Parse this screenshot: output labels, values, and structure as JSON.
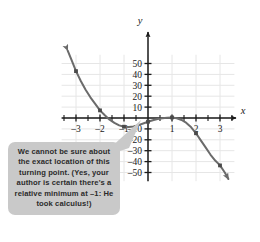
{
  "figure": {
    "background_color": "#ffffff"
  },
  "callout": {
    "text": "We cannot be sure about the exact location of this turning point. (Yes, your author is certain there's a relative minimum at –1: He took calculus!)",
    "background_color": "#c9c9c9",
    "text_color": "#2b2b2b",
    "pointer_target": "turning point near x = -1"
  },
  "chart_data": {
    "type": "line",
    "title": "",
    "xlabel": "x",
    "ylabel": "y",
    "xlim": [
      -3.6,
      3.6
    ],
    "ylim": [
      -58,
      58
    ],
    "grid": true,
    "grid_color": "#e6e6e6",
    "curve_color": "#6b6b6b",
    "axis_color": "#1a1a1a",
    "xticks": [
      -3,
      -2,
      -1,
      1,
      2,
      3
    ],
    "xtick_labels": [
      "–3",
      "–2",
      "–1",
      "1",
      "2",
      "3"
    ],
    "yticks": [
      -50,
      -40,
      -30,
      -20,
      -10,
      10,
      20,
      30,
      40,
      50
    ],
    "ytick_labels": [
      "–50",
      "–40",
      "–30",
      "–20",
      "–10",
      "10",
      "20",
      "30",
      "40",
      "50"
    ],
    "series": [
      {
        "name": "f(x)",
        "arrow_start": true,
        "arrow_end": true,
        "x": [
          -3.35,
          -3.2,
          -3.0,
          -2.8,
          -2.6,
          -2.4,
          -2.2,
          -2.0,
          -1.8,
          -1.6,
          -1.4,
          -1.2,
          -1.0,
          -0.8,
          -0.6,
          -0.4,
          -0.2,
          0.0,
          0.2,
          0.4,
          0.6,
          0.8,
          1.0,
          1.2,
          1.4,
          1.6,
          1.8,
          2.0,
          2.2,
          2.4,
          2.6,
          2.8,
          3.0,
          3.2,
          3.35
        ],
        "y": [
          62,
          54,
          43,
          34,
          26,
          19,
          13,
          7,
          2.5,
          -1.5,
          -4.5,
          -6.8,
          -8.0,
          -8.3,
          -7.8,
          -6.5,
          -5.0,
          -3.4,
          -2.0,
          -0.9,
          -0.2,
          0.2,
          0.5,
          -0.2,
          -1.8,
          -4.5,
          -8.5,
          -14.0,
          -20.5,
          -27.0,
          -33.5,
          -39.0,
          -43.5,
          -50.0,
          -56.0
        ]
      }
    ],
    "marked_points": [
      {
        "x": -3.0,
        "y": 43
      },
      {
        "x": -2.0,
        "y": 7
      },
      {
        "x": -1.0,
        "y": -8
      },
      {
        "x": 0.0,
        "y": -3.4
      },
      {
        "x": 1.0,
        "y": 0.5
      },
      {
        "x": 2.0,
        "y": -14
      },
      {
        "x": 3.0,
        "y": -43.5
      }
    ]
  }
}
